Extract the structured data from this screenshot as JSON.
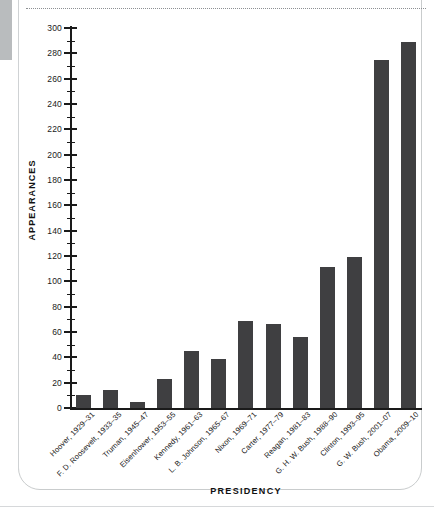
{
  "chart_data": {
    "type": "bar",
    "title": "",
    "xlabel": "PRESIDENCY",
    "ylabel": "APPEARANCES",
    "ylim": [
      0,
      300
    ],
    "ytick_step": 20,
    "yminor_step": 10,
    "grid": false,
    "legend": null,
    "bar_color": "#3f3f41",
    "categories": [
      "Hoover, 1929–31",
      "F. D. Roosevelt, 1933–35",
      "Truman, 1945–47",
      "Eisenhower, 1953–55",
      "Kennedy, 1961–63",
      "L. B. Johnson, 1965–67",
      "Nixon, 1969–71",
      "Carter, 1977–79",
      "Reagan, 1981–83",
      "G. H. W. Bush, 1988–90",
      "Clinton, 1993–95",
      "G. W. Bush, 2001–07",
      "Obama, 2009–10"
    ],
    "values": [
      10,
      14,
      5,
      23,
      45,
      39,
      69,
      66,
      56,
      111,
      119,
      275,
      289
    ],
    "ytick_labels": [
      "0",
      "20",
      "40",
      "60",
      "80",
      "100",
      "120",
      "140",
      "160",
      "180",
      "200",
      "220",
      "240",
      "260",
      "280",
      "300"
    ]
  }
}
